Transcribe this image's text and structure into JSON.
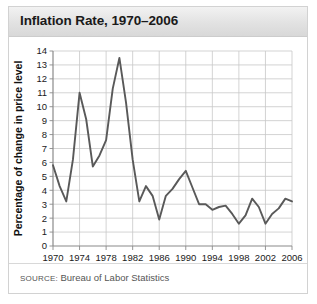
{
  "panel": {
    "title": "Inflation Rate, 1970–2006",
    "source_label": "SOURCE:",
    "source_text": "Bureau of Labor Statistics"
  },
  "chart_data": {
    "type": "line",
    "title": "Inflation Rate, 1970–2006",
    "xlabel": "",
    "ylabel": "Percentage of change in price level",
    "xlim": [
      1970,
      2006
    ],
    "ylim": [
      0,
      14
    ],
    "grid": true,
    "legend": false,
    "line_color": "#595959",
    "xticks": [
      1970,
      1974,
      1978,
      1982,
      1986,
      1990,
      1994,
      1998,
      2002,
      2006
    ],
    "yticks": [
      0,
      1,
      2,
      3,
      4,
      5,
      6,
      7,
      8,
      9,
      10,
      11,
      12,
      13,
      14
    ],
    "x": [
      1970,
      1971,
      1972,
      1973,
      1974,
      1975,
      1976,
      1977,
      1978,
      1979,
      1980,
      1981,
      1982,
      1983,
      1984,
      1985,
      1986,
      1987,
      1988,
      1989,
      1990,
      1991,
      1992,
      1993,
      1994,
      1995,
      1996,
      1997,
      1998,
      1999,
      2000,
      2001,
      2002,
      2003,
      2004,
      2005,
      2006
    ],
    "values": [
      5.8,
      4.3,
      3.2,
      6.2,
      11.0,
      9.1,
      5.7,
      6.5,
      7.6,
      11.3,
      13.5,
      10.3,
      6.2,
      3.2,
      4.3,
      3.6,
      1.9,
      3.6,
      4.1,
      4.8,
      5.4,
      4.2,
      3.0,
      3.0,
      2.6,
      2.8,
      2.9,
      2.3,
      1.6,
      2.2,
      3.4,
      2.8,
      1.6,
      2.3,
      2.7,
      3.4,
      3.2
    ]
  }
}
